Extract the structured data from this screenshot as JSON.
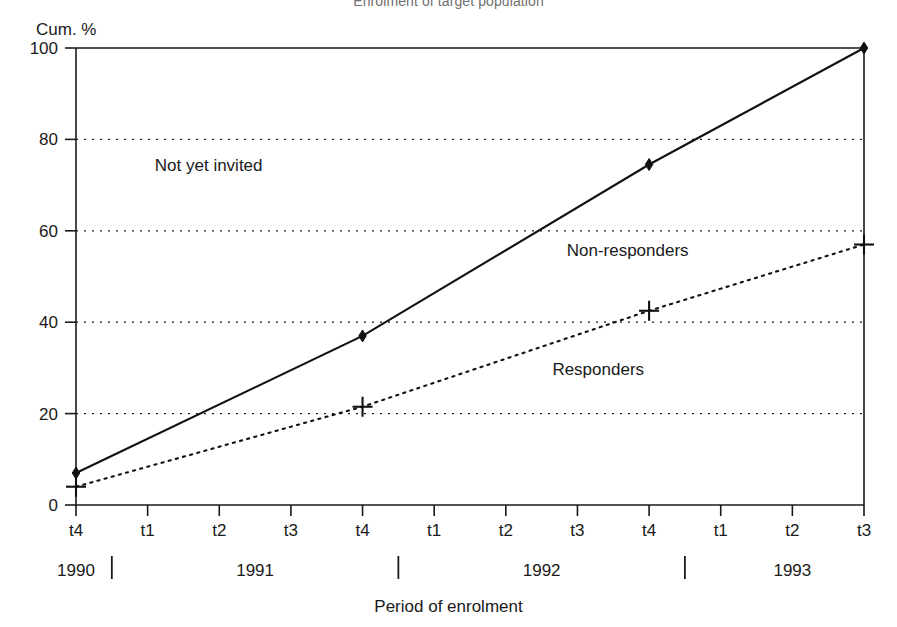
{
  "chart_data": {
    "type": "line",
    "title": "Enrolment of target population",
    "xlabel": "Period of enrolment",
    "ylabel": "Cum. %",
    "ylim": [
      0,
      100
    ],
    "yticks": [
      0,
      20,
      40,
      60,
      80,
      100
    ],
    "grid": "horizontal-dotted",
    "legend": "in-plot-annotations",
    "x": [
      "t4",
      "t1",
      "t2",
      "t3",
      "t4",
      "t1",
      "t2",
      "t3",
      "t4",
      "t1",
      "t2",
      "t3"
    ],
    "x_groups": [
      {
        "label": "1990",
        "ticks": [
          "t4"
        ]
      },
      {
        "label": "1991",
        "ticks": [
          "t1",
          "t2",
          "t3",
          "t4"
        ]
      },
      {
        "label": "1992",
        "ticks": [
          "t1",
          "t2",
          "t3",
          "t4"
        ]
      },
      {
        "label": "1993",
        "ticks": [
          "t1",
          "t2",
          "t3"
        ]
      }
    ],
    "series": [
      {
        "name": "Non-responders",
        "style": "solid",
        "marker": "filled-diamond",
        "points": [
          {
            "x": "t4 1990",
            "xindex": 0,
            "y": 7
          },
          {
            "x": "t4 1991",
            "xindex": 4,
            "y": 37
          },
          {
            "x": "t4 1992",
            "xindex": 8,
            "y": 74.5
          },
          {
            "x": "t3 1993",
            "xindex": 11,
            "y": 100
          }
        ]
      },
      {
        "name": "Responders",
        "style": "dotted",
        "marker": "plus",
        "points": [
          {
            "x": "t4 1990",
            "xindex": 0,
            "y": 4
          },
          {
            "x": "t4 1991",
            "xindex": 4,
            "y": 21.5
          },
          {
            "x": "t4 1992",
            "xindex": 8,
            "y": 42.5
          },
          {
            "x": "t3 1993",
            "xindex": 11,
            "y": 57
          }
        ]
      }
    ],
    "annotations": [
      {
        "text": "Not yet invited",
        "x": 1.1,
        "y": 73,
        "name": "annotation-not-yet-invited"
      },
      {
        "text": "Non-responders",
        "x": 6.85,
        "y": 54.5,
        "name": "annotation-non-responders"
      },
      {
        "text": "Responders",
        "x": 6.65,
        "y": 28.5,
        "name": "annotation-responders"
      }
    ],
    "colors": {
      "axis": "#1a1a1a",
      "series": "#111111",
      "grid": "#1a1a1a",
      "title": "#6f6f6f",
      "background": "#ffffff"
    }
  }
}
